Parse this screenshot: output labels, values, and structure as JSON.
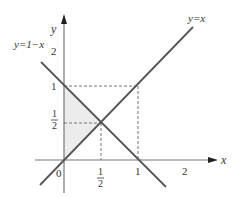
{
  "diagram": {
    "type": "function-graph",
    "axes": {
      "x_label": "x",
      "y_label": "y",
      "origin_label": "0",
      "x_ticks": [
        {
          "num": "1",
          "den": "2"
        },
        {
          "label": "1"
        },
        {
          "label": "2"
        }
      ],
      "y_ticks": [
        {
          "num": "1",
          "den": "2"
        },
        {
          "label": "1"
        },
        {
          "label": "2"
        }
      ]
    },
    "lines": [
      {
        "name": "y=x",
        "label": "y=x",
        "color": "#555555"
      },
      {
        "name": "y=1-x",
        "label": "y=1−x",
        "color": "#555555"
      }
    ],
    "intersection": {
      "x": "1/2",
      "y": "1/2"
    },
    "shaded_region": {
      "description": "triangle bounded by y-axis, y=x and y=1-x",
      "vertices": [
        [
          0,
          0
        ],
        [
          0,
          1
        ],
        [
          0.5,
          0.5
        ]
      ],
      "color": "#ececec"
    },
    "guide_lines": [
      {
        "from": [
          0,
          1
        ],
        "to": [
          1,
          1
        ],
        "style": "dashed"
      },
      {
        "from": [
          1,
          1
        ],
        "to": [
          1,
          0
        ],
        "style": "dashed"
      },
      {
        "from": [
          0,
          0.5
        ],
        "to": [
          0.5,
          0.5
        ],
        "style": "dashed"
      },
      {
        "from": [
          0.5,
          0.5
        ],
        "to": [
          0.5,
          0
        ],
        "style": "dashed"
      }
    ],
    "colors": {
      "axis": "#666666",
      "line": "#555555",
      "dash": "#777777",
      "fill": "#ececec"
    }
  }
}
